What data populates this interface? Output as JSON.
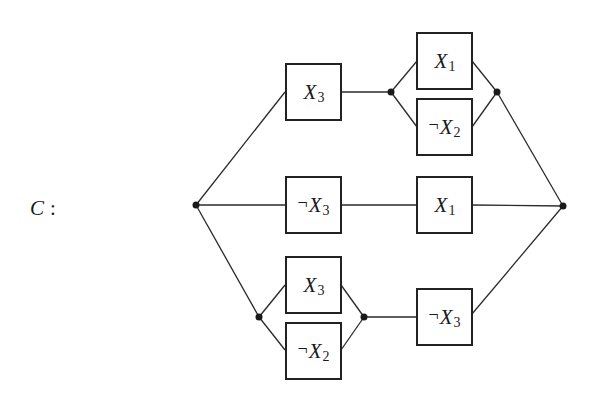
{
  "label": {
    "name": "C",
    "separator": ":"
  },
  "colors": {
    "wire": "#2a2a2a",
    "box_border": "#222222",
    "node": "#1a1a1a",
    "background": "#ffffff"
  },
  "gates": [
    {
      "id": "g-top-x3",
      "negated": false,
      "neg_symbol": "",
      "var": "X",
      "sub": "3"
    },
    {
      "id": "g-top-x1",
      "negated": false,
      "neg_symbol": "",
      "var": "X",
      "sub": "1"
    },
    {
      "id": "g-top-notx2",
      "negated": true,
      "neg_symbol": "¬",
      "var": "X",
      "sub": "2"
    },
    {
      "id": "g-mid-notx3",
      "negated": true,
      "neg_symbol": "¬",
      "var": "X",
      "sub": "3"
    },
    {
      "id": "g-mid-x1",
      "negated": false,
      "neg_symbol": "",
      "var": "X",
      "sub": "1"
    },
    {
      "id": "g-bot-x3",
      "negated": false,
      "neg_symbol": "",
      "var": "X",
      "sub": "3"
    },
    {
      "id": "g-bot-notx2",
      "negated": true,
      "neg_symbol": "¬",
      "var": "X",
      "sub": "2"
    },
    {
      "id": "g-bot-notx3",
      "negated": true,
      "neg_symbol": "¬",
      "var": "X",
      "sub": "3"
    }
  ],
  "structure": {
    "top_branch": "X3 in series with (X1 parallel ¬X2)",
    "middle_branch": "¬X3 in series with X1",
    "bottom_branch": "(X3 parallel ¬X2) in series with ¬X3",
    "overall": "three branches in parallel"
  }
}
